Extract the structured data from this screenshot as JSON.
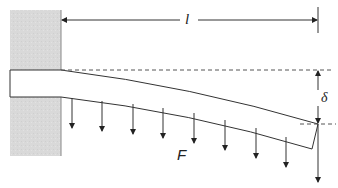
{
  "diagram": {
    "labels": {
      "length": "l",
      "deflection": "δ",
      "force": "F"
    },
    "colors": {
      "wall": "#d9d9d9",
      "line": "#333333",
      "dashed": "#555555"
    },
    "force_arrows_x": [
      72,
      102,
      133,
      163,
      194,
      225,
      256,
      286
    ]
  }
}
